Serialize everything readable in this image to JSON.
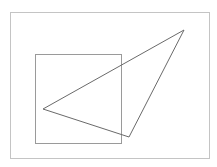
{
  "canvas": {
    "width": 217,
    "height": 167,
    "background": "#ffffff"
  },
  "shapes": {
    "frame": {
      "type": "rect",
      "x": 10.5,
      "y": 12.5,
      "width": 199,
      "height": 146,
      "stroke": "#c4c4c4",
      "stroke_width": 1
    },
    "square": {
      "type": "rect",
      "x": 35.5,
      "y": 54.5,
      "width": 86,
      "height": 89,
      "stroke": "#9a9a9a",
      "stroke_width": 1
    },
    "triangle": {
      "type": "polygon",
      "points": [
        [
          184,
          30
        ],
        [
          43,
          109
        ],
        [
          129,
          137
        ]
      ],
      "stroke": "#6a6a6a",
      "stroke_width": 1
    }
  }
}
